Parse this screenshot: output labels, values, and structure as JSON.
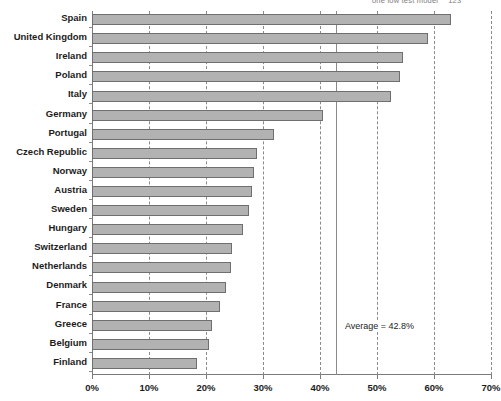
{
  "top_partial_text": {
    "text": "one low test model",
    "number": "123"
  },
  "annotation": {
    "average_label": "Average = 42.8%"
  },
  "chart_data": {
    "type": "bar",
    "orientation": "horizontal",
    "title": "",
    "xlabel": "",
    "ylabel": "",
    "xlim": [
      0,
      70
    ],
    "xtick_labels": [
      "0%",
      "10%",
      "20%",
      "30%",
      "40%",
      "50%",
      "60%",
      "70%"
    ],
    "xticks": [
      0,
      10,
      20,
      30,
      40,
      50,
      60,
      70
    ],
    "grid": true,
    "grid_axis": "x",
    "grid_style": "dashed",
    "legend": false,
    "bar_color": "#b2b2b2",
    "bar_edge_color": "#6f6f6f",
    "average_line": {
      "value": 42.8,
      "label": "Average = 42.8%",
      "style": "solid",
      "color": "#8a8a8a"
    },
    "categories": [
      "Spain",
      "United Kingdom",
      "Ireland",
      "Poland",
      "Italy",
      "Germany",
      "Portugal",
      "Czech Republic",
      "Norway",
      "Austria",
      "Sweden",
      "Hungary",
      "Switzerland",
      "Netherlands",
      "Denmark",
      "France",
      "Greece",
      "Belgium",
      "Finland"
    ],
    "values": [
      63.0,
      59.0,
      54.5,
      54.0,
      52.5,
      40.5,
      32.0,
      29.0,
      28.5,
      28.0,
      27.5,
      26.5,
      24.5,
      24.3,
      23.5,
      22.5,
      21.0,
      20.6,
      18.5
    ]
  }
}
